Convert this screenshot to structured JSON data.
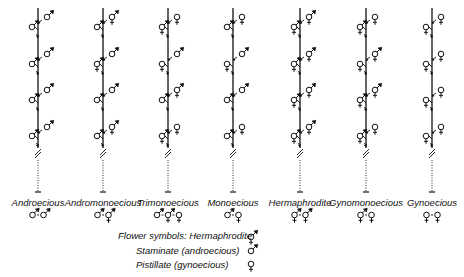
{
  "diagram": {
    "columns": [
      {
        "name": "Androecious",
        "x": 38,
        "right": [
          "S",
          "S",
          "S",
          "S"
        ],
        "left": [
          "S",
          "S",
          "S",
          "S"
        ],
        "summary": [
          "S",
          "S"
        ]
      },
      {
        "name": "Andromonoecious",
        "x": 103,
        "right": [
          "H",
          "S",
          "S",
          "H"
        ],
        "left": [
          "S",
          "H",
          "S",
          "S"
        ],
        "summary": [
          "S",
          "H"
        ]
      },
      {
        "name": "Trimonoecious",
        "x": 168,
        "right": [
          "P",
          "S",
          "H",
          "P"
        ],
        "left": [
          "H",
          "P",
          "S",
          "H"
        ],
        "summary": [
          "S",
          "H",
          "P"
        ]
      },
      {
        "name": "Monoecious",
        "x": 233,
        "right": [
          "P",
          "S",
          "S",
          "P"
        ],
        "left": [
          "S",
          "P",
          "S",
          "S"
        ],
        "summary": [
          "S",
          "P"
        ]
      },
      {
        "name": "Hermaphrodite",
        "x": 300,
        "right": [
          "H",
          "H",
          "H",
          "H"
        ],
        "left": [
          "H",
          "H",
          "H",
          "H"
        ],
        "summary": [
          "H",
          "H"
        ]
      },
      {
        "name": "Gynomonoecious",
        "x": 366,
        "right": [
          "P",
          "H",
          "H",
          "P"
        ],
        "left": [
          "H",
          "P",
          "H",
          "H"
        ],
        "summary": [
          "H",
          "P"
        ]
      },
      {
        "name": "Gynoecious",
        "x": 432,
        "right": [
          "P",
          "P",
          "P",
          "P"
        ],
        "left": [
          "P",
          "P",
          "P",
          "P"
        ],
        "summary": [
          "P",
          "P"
        ]
      }
    ],
    "legend": {
      "title": "Flower symbols:",
      "items": [
        {
          "label": "Hermaphrodite",
          "symbol": "H"
        },
        {
          "label": "Staminate (androecious)",
          "symbol": "S"
        },
        {
          "label": "Pistillate (gynoecious)",
          "symbol": "P"
        }
      ]
    },
    "labels": {
      "col0": "Androecious",
      "col1": "Andromonoecious",
      "col2": "Trimonoecious",
      "col3": "Monoecious",
      "col4": "Hermaphrodite",
      "col5": "Gynomonoecious",
      "col6": "Gynoecious"
    },
    "legend_labels": {
      "title": "Flower symbols: Hermaphrodite",
      "staminate": "Staminate (androecious)",
      "pistillate": "Pistillate (gynoecious)"
    },
    "colors": {
      "ink": "#111111",
      "background": "#ffffff"
    }
  }
}
